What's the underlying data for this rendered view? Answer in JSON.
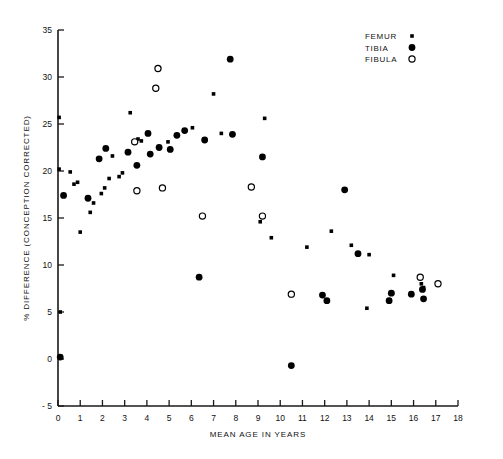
{
  "chart_data": {
    "type": "scatter",
    "title": "",
    "xlabel": "MEAN AGE IN YEARS",
    "ylabel": "% DIFFERENCE (CONCEPTION CORRECTED)",
    "xlim": [
      0,
      18
    ],
    "ylim": [
      -5,
      35
    ],
    "xticks": [
      0,
      1,
      2,
      3,
      4,
      5,
      6,
      7,
      8,
      9,
      10,
      11,
      12,
      13,
      14,
      15,
      16,
      17,
      18
    ],
    "yticks": [
      -5,
      0,
      5,
      10,
      15,
      20,
      25,
      30,
      35
    ],
    "xtick_labels": [
      "0",
      "1",
      "2",
      "3",
      "4",
      "5",
      "6",
      "7",
      "8",
      "9",
      "10",
      "11",
      "12",
      "13",
      "14",
      "15",
      "16",
      "17",
      "18"
    ],
    "ytick_labels": [
      "- 5",
      "0",
      "5",
      "10",
      "15",
      "20",
      "25",
      "30",
      "35"
    ],
    "grid": false,
    "legend_position": "top-right",
    "series": [
      {
        "name": "FEMUR",
        "marker": "small-filled-square",
        "color": "#000000",
        "points": [
          [
            0.05,
            25.7
          ],
          [
            0.05,
            20.2
          ],
          [
            0.55,
            19.9
          ],
          [
            0.72,
            18.6
          ],
          [
            0.88,
            18.8
          ],
          [
            1.0,
            13.5
          ],
          [
            0.1,
            5.0
          ],
          [
            1.45,
            15.6
          ],
          [
            1.6,
            16.6
          ],
          [
            1.95,
            17.6
          ],
          [
            2.1,
            18.2
          ],
          [
            2.3,
            19.2
          ],
          [
            2.45,
            21.6
          ],
          [
            2.75,
            19.4
          ],
          [
            2.9,
            19.8
          ],
          [
            3.25,
            26.2
          ],
          [
            3.6,
            23.4
          ],
          [
            3.75,
            23.2
          ],
          [
            4.95,
            23.1
          ],
          [
            6.05,
            24.6
          ],
          [
            7.0,
            28.2
          ],
          [
            7.35,
            24.0
          ],
          [
            9.3,
            25.6
          ],
          [
            9.1,
            14.6
          ],
          [
            9.6,
            12.9
          ],
          [
            11.2,
            11.9
          ],
          [
            12.3,
            13.6
          ],
          [
            13.2,
            12.1
          ],
          [
            14.0,
            11.1
          ],
          [
            13.9,
            5.4
          ],
          [
            15.1,
            8.9
          ],
          [
            16.35,
            8.0
          ],
          [
            16.45,
            7.6
          ],
          [
            15.05,
            7.0
          ]
        ]
      },
      {
        "name": "TIBIA",
        "marker": "filled-circle",
        "color": "#000000",
        "points": [
          [
            0.1,
            0.2
          ],
          [
            0.25,
            17.4
          ],
          [
            1.35,
            17.1
          ],
          [
            1.85,
            21.3
          ],
          [
            2.15,
            22.4
          ],
          [
            3.15,
            22.0
          ],
          [
            3.55,
            20.6
          ],
          [
            4.05,
            24.0
          ],
          [
            4.15,
            21.8
          ],
          [
            4.55,
            22.5
          ],
          [
            5.05,
            22.3
          ],
          [
            5.35,
            23.8
          ],
          [
            5.7,
            24.3
          ],
          [
            6.35,
            8.7
          ],
          [
            6.6,
            23.3
          ],
          [
            7.75,
            31.9
          ],
          [
            7.85,
            23.9
          ],
          [
            9.2,
            21.5
          ],
          [
            10.5,
            -0.7
          ],
          [
            11.9,
            6.8
          ],
          [
            12.1,
            6.2
          ],
          [
            12.9,
            18.0
          ],
          [
            13.5,
            11.2
          ],
          [
            14.9,
            6.2
          ],
          [
            15.0,
            7.0
          ],
          [
            15.9,
            6.9
          ],
          [
            16.4,
            7.4
          ],
          [
            16.45,
            6.4
          ]
        ]
      },
      {
        "name": "FIBULA",
        "marker": "open-circle",
        "color": "#000000",
        "points": [
          [
            3.45,
            23.1
          ],
          [
            3.55,
            17.9
          ],
          [
            4.4,
            28.8
          ],
          [
            4.5,
            30.9
          ],
          [
            4.7,
            18.2
          ],
          [
            6.5,
            15.2
          ],
          [
            8.7,
            18.3
          ],
          [
            9.2,
            15.2
          ],
          [
            10.5,
            6.9
          ],
          [
            16.3,
            8.7
          ],
          [
            17.1,
            8.0
          ]
        ]
      }
    ]
  },
  "legend": {
    "entries": [
      {
        "label": "FEMUR",
        "marker": "small-filled-square"
      },
      {
        "label": "TIBIA",
        "marker": "filled-circle"
      },
      {
        "label": "FIBULA",
        "marker": "open-circle"
      }
    ]
  }
}
